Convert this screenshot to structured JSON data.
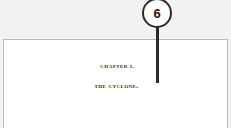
{
  "annotation": {
    "badge_number": "6",
    "badge_icon": "numbered-callout-circle-icon",
    "leader_icon": "leader-line-icon",
    "badge_border_color": "#2b2b2b",
    "leader_color": "#2b2b2b"
  },
  "page": {
    "chapter_label": "Chapter I.",
    "chapter_title": "The Cyclone.",
    "border_color": "#b8b8b8",
    "background_color": "#ffffff"
  },
  "canvas": {
    "background_color": "#f2f2f2"
  }
}
